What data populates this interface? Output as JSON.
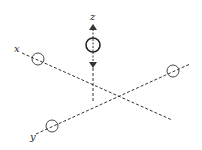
{
  "diagram": {
    "type": "3d-axes-with-atoms",
    "axes": {
      "x": {
        "label": "x"
      },
      "y": {
        "label": "y"
      },
      "z": {
        "label": "z"
      }
    },
    "colors": {
      "line": "#333333",
      "background": "#ffffff"
    },
    "elements": [
      {
        "kind": "circle",
        "position": "on x-axis near x label"
      },
      {
        "kind": "circle",
        "position": "on y-axis near y label"
      },
      {
        "kind": "circle",
        "position": "on y-axis far end (right)"
      },
      {
        "kind": "circle",
        "position": "on z-axis with double-headed arrow (up and down)",
        "emphasis": "bold"
      }
    ]
  }
}
